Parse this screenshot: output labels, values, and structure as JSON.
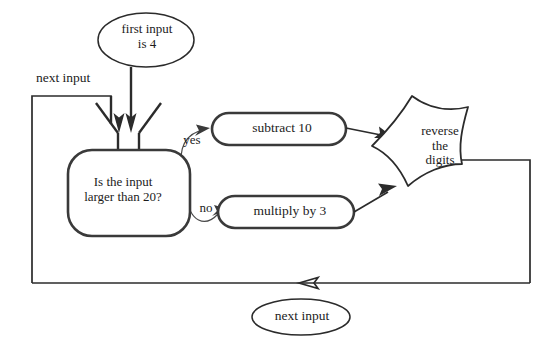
{
  "diagram": {
    "colors": {
      "background": "#ffffff",
      "shape_stroke": "#3a3a3a",
      "line_stroke": "#2b2b2b",
      "text": "#1c1c1c"
    },
    "nodes": {
      "start": {
        "id": "first-input",
        "shape": "ellipse",
        "text": "first input\nis 4"
      },
      "next_input_top": {
        "id": "next-input-top",
        "shape": "text-label",
        "text": "next input"
      },
      "decision": {
        "id": "is-input-larger-than-20",
        "shape": "rounded-rectangle",
        "text": "Is the input\nlarger than 20?"
      },
      "branch_yes": {
        "id": "yes",
        "shape": "edge-label",
        "text": "yes"
      },
      "branch_no": {
        "id": "no",
        "shape": "edge-label",
        "text": "no"
      },
      "subtract": {
        "id": "subtract-10",
        "shape": "stadium",
        "text": "subtract 10"
      },
      "multiply": {
        "id": "multiply-by-3",
        "shape": "stadium",
        "text": "multiply by 3"
      },
      "reverse": {
        "id": "reverse-the-digits",
        "shape": "irregular-star",
        "text": "reverse\nthe\ndigits"
      },
      "next_input_bottom": {
        "id": "next-input-bottom",
        "shape": "ellipse",
        "text": "next input"
      }
    },
    "edges": [
      {
        "from": "first-input",
        "to": "is-input-larger-than-20",
        "label": "",
        "arrow": "down"
      },
      {
        "from": "next-input-top",
        "to": "is-input-larger-than-20",
        "label": "",
        "arrow": "down"
      },
      {
        "from": "is-input-larger-than-20",
        "to": "subtract-10",
        "label": "yes",
        "arrow": "right"
      },
      {
        "from": "is-input-larger-than-20",
        "to": "multiply-by-3",
        "label": "no",
        "arrow": "right"
      },
      {
        "from": "subtract-10",
        "to": "reverse-the-digits",
        "label": "",
        "arrow": "right"
      },
      {
        "from": "multiply-by-3",
        "to": "reverse-the-digits",
        "label": "",
        "arrow": "up-right"
      },
      {
        "from": "reverse-the-digits",
        "to": "is-input-larger-than-20",
        "label": "next input",
        "arrow": "left"
      }
    ]
  }
}
